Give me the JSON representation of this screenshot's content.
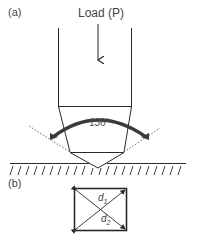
{
  "panel_a": {
    "label": "(a)",
    "load_label": "Load (P)",
    "angle_label": "136°"
  },
  "panel_b": {
    "label": "(b)",
    "diag1": {
      "symbol": "d",
      "sub": "1"
    },
    "diag2": {
      "symbol": "d",
      "sub": "2"
    }
  },
  "colors": {
    "line": "#2a2a2a",
    "arc": "#3a3a3a",
    "dotted": "#555555"
  }
}
